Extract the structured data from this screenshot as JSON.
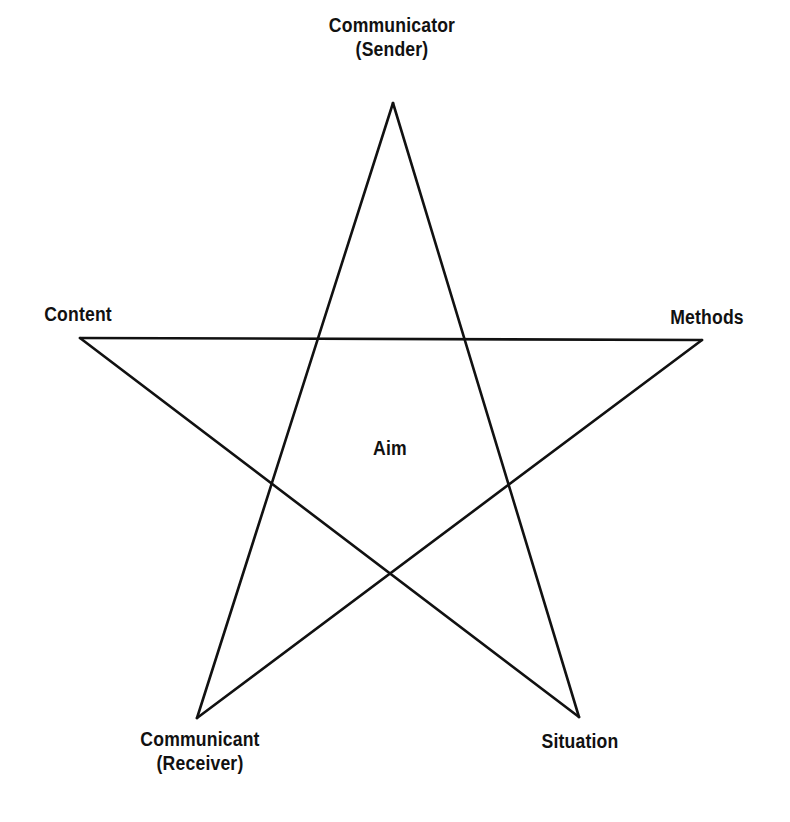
{
  "diagram": {
    "type": "pentagram",
    "line_color": "#111111",
    "center_label": "Aim",
    "vertices": [
      {
        "id": "top",
        "line1": "Communicator",
        "line2": "(Sender)",
        "x": 393,
        "y": 103
      },
      {
        "id": "right",
        "line1": "Methods",
        "line2": "",
        "x": 702,
        "y": 340
      },
      {
        "id": "bottom-right",
        "line1": "Situation",
        "line2": "",
        "x": 579,
        "y": 717
      },
      {
        "id": "bottom-left",
        "line1": "Communicant",
        "line2": "(Receiver)",
        "x": 197,
        "y": 718
      },
      {
        "id": "left",
        "line1": "Content",
        "line2": "",
        "x": 80,
        "y": 338
      }
    ]
  }
}
